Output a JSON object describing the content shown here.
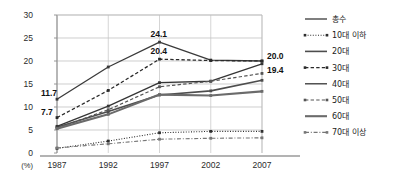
{
  "chart_data": {
    "type": "line",
    "title": "",
    "xlabel": "",
    "ylabel": "",
    "unit_label": "(%)",
    "categories": [
      "1987",
      "1992",
      "1997",
      "2002",
      "2007"
    ],
    "x": [
      1987,
      1992,
      1997,
      2002,
      2007
    ],
    "ylim": [
      0,
      30
    ],
    "yticks": [
      0,
      5,
      10,
      15,
      20,
      25,
      30
    ],
    "grid": "horizontal-and-vertical",
    "legend_position": "right",
    "series": [
      {
        "name": "총수",
        "values": [
          11.7,
          18.7,
          24.1,
          20.2,
          20.0
        ],
        "style": "solid",
        "color": "#3a3a3a",
        "width": 1.3
      },
      {
        "name": "10대 이하",
        "values": [
          1.0,
          2.6,
          4.4,
          4.7,
          4.7
        ],
        "style": "dotted",
        "color": "#2e2e2e",
        "width": 1.1
      },
      {
        "name": "20대",
        "values": [
          5.6,
          9.0,
          12.6,
          13.5,
          15.8
        ],
        "style": "solid",
        "color": "#4d4d4d",
        "width": 1.6
      },
      {
        "name": "30대",
        "values": [
          7.7,
          13.6,
          20.4,
          20.1,
          20.0
        ],
        "style": "dashed",
        "color": "#2a2a2a",
        "width": 1.3
      },
      {
        "name": "40대",
        "values": [
          5.8,
          10.2,
          15.3,
          15.6,
          19.4
        ],
        "style": "solid",
        "color": "#353535",
        "width": 1.3
      },
      {
        "name": "50대",
        "values": [
          5.4,
          9.4,
          14.4,
          15.6,
          17.3
        ],
        "style": "dashed",
        "color": "#555555",
        "width": 1.2
      },
      {
        "name": "60대",
        "values": [
          5.3,
          8.4,
          12.7,
          12.5,
          13.4
        ],
        "style": "solid",
        "color": "#6b6b6b",
        "width": 2.1
      },
      {
        "name": "70대 이상",
        "values": [
          1.1,
          2.0,
          3.0,
          3.2,
          3.3
        ],
        "style": "dashdot",
        "color": "#767676",
        "width": 1.1
      }
    ],
    "data_labels": [
      {
        "text": "11.7",
        "series": "총수",
        "x": 1987,
        "y": 11.7
      },
      {
        "text": "7.7",
        "series": "30대",
        "x": 1987,
        "y": 7.7
      },
      {
        "text": "24.1",
        "series": "총수",
        "x": 1997,
        "y": 24.1
      },
      {
        "text": "20.4",
        "series": "30대",
        "x": 1997,
        "y": 20.4
      },
      {
        "text": "20.0",
        "series": "총수",
        "x": 2007,
        "y": 20.0
      },
      {
        "text": "19.4",
        "series": "40대",
        "x": 2007,
        "y": 19.4
      }
    ]
  }
}
